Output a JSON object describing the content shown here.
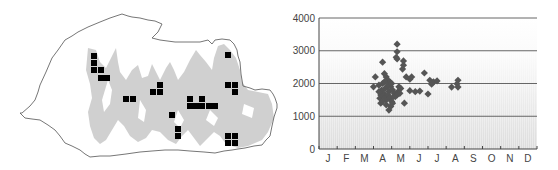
{
  "map": {
    "title": "Distribution map",
    "outline_color": "#555555",
    "relief_color": "#cfcfcf",
    "marker_color": "#000000",
    "markers": [
      [
        91,
        53
      ],
      [
        91,
        60
      ],
      [
        91,
        67
      ],
      [
        98,
        67
      ],
      [
        98,
        75
      ],
      [
        104,
        75
      ],
      [
        123,
        96
      ],
      [
        130,
        96
      ],
      [
        150,
        89
      ],
      [
        157,
        89
      ],
      [
        157,
        82
      ],
      [
        169,
        112
      ],
      [
        175,
        126
      ],
      [
        175,
        133
      ],
      [
        187,
        96
      ],
      [
        199,
        96
      ],
      [
        187,
        103
      ],
      [
        193,
        103
      ],
      [
        199,
        103
      ],
      [
        206,
        103
      ],
      [
        212,
        103
      ],
      [
        225,
        52
      ],
      [
        225,
        82
      ],
      [
        232,
        82
      ],
      [
        232,
        89
      ],
      [
        225,
        133
      ],
      [
        232,
        133
      ],
      [
        225,
        140
      ],
      [
        232,
        140
      ]
    ]
  },
  "chart_data": {
    "type": "scatter",
    "title": "",
    "xlabel": "Month",
    "ylabel": "Elevation (m)",
    "categories": [
      "J",
      "F",
      "M",
      "A",
      "M",
      "J",
      "J",
      "A",
      "S",
      "O",
      "N",
      "D"
    ],
    "yticks": [
      0,
      1000,
      2000,
      3000,
      4000
    ],
    "ylim": [
      0,
      4000
    ],
    "grid": "horizontal",
    "marker": "diamond",
    "marker_color": "#555555",
    "gridline_color": "#666666",
    "series": [
      {
        "name": "records",
        "points": [
          [
            4.3,
            3200
          ],
          [
            4.3,
            2970
          ],
          [
            4.25,
            2800
          ],
          [
            4.3,
            2750
          ],
          [
            3.5,
            2650
          ],
          [
            4.65,
            2690
          ],
          [
            4.65,
            2560
          ],
          [
            4.6,
            2440
          ],
          [
            3.1,
            2200
          ],
          [
            3.0,
            1900
          ],
          [
            3.3,
            1950
          ],
          [
            4.8,
            2200
          ],
          [
            5.0,
            2130
          ],
          [
            5.1,
            2200
          ],
          [
            5.8,
            2320
          ],
          [
            6.1,
            2100
          ],
          [
            6.3,
            2050
          ],
          [
            6.5,
            2080
          ],
          [
            6.2,
            1980
          ],
          [
            6.0,
            1680
          ],
          [
            5.0,
            1780
          ],
          [
            5.3,
            1750
          ],
          [
            5.55,
            1770
          ],
          [
            7.3,
            1890
          ],
          [
            7.65,
            1890
          ],
          [
            7.65,
            2100
          ],
          [
            7.6,
            1990
          ],
          [
            4.7,
            1400
          ],
          [
            3.85,
            1190
          ],
          [
            3.4,
            1400
          ],
          [
            3.35,
            1550
          ],
          [
            3.5,
            2000
          ],
          [
            3.6,
            2300
          ],
          [
            3.7,
            2200
          ],
          [
            3.8,
            2100
          ],
          [
            3.9,
            2050
          ],
          [
            3.45,
            1800
          ],
          [
            3.55,
            1700
          ],
          [
            3.65,
            1850
          ],
          [
            3.75,
            1900
          ],
          [
            3.85,
            1750
          ],
          [
            3.6,
            1600
          ],
          [
            3.7,
            1500
          ],
          [
            3.8,
            1650
          ],
          [
            3.9,
            1550
          ],
          [
            4.0,
            1450
          ],
          [
            3.95,
            1900
          ],
          [
            4.05,
            1800
          ],
          [
            4.15,
            1700
          ],
          [
            3.5,
            1450
          ],
          [
            3.7,
            1350
          ],
          [
            4.2,
            1600
          ],
          [
            4.35,
            1750
          ],
          [
            4.4,
            1900
          ],
          [
            4.5,
            1850
          ],
          [
            4.3,
            1650
          ],
          [
            4.45,
            1700
          ],
          [
            3.6,
            2050
          ],
          [
            3.8,
            1950
          ],
          [
            4.0,
            2000
          ],
          [
            4.1,
            1600
          ],
          [
            3.95,
            1300
          ],
          [
            4.05,
            1400
          ],
          [
            3.4,
            1650
          ],
          [
            3.3,
            1750
          ]
        ]
      }
    ]
  }
}
